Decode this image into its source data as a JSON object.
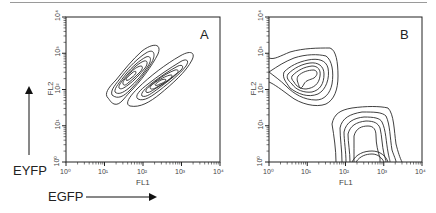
{
  "figure": {
    "annotations": {
      "y_marker": "EYFP",
      "x_marker": "EGFP"
    },
    "panels": [
      {
        "id": "A",
        "label": "A",
        "xlabel": "FL1",
        "ylabel": "FL2"
      },
      {
        "id": "B",
        "label": "B",
        "xlabel": "FL1",
        "ylabel": "FL2"
      }
    ],
    "tick_labels": [
      "10⁰",
      "10¹",
      "10²",
      "10³",
      "10⁴"
    ],
    "colors": {
      "contour": "#2a2a2a",
      "axis": "#222222",
      "rule": "#9a9a9a"
    }
  },
  "chart_data": [
    {
      "type": "contour",
      "title": "A",
      "xlabel": "FL1",
      "ylabel": "FL2",
      "xscale": "log",
      "yscale": "log",
      "xlim": [
        1,
        10000
      ],
      "ylim": [
        1,
        10000
      ],
      "xticks": [
        "10^0",
        "10^1",
        "10^2",
        "10^3",
        "10^4"
      ],
      "yticks": [
        "10^0",
        "10^1",
        "10^2",
        "10^3",
        "10^4"
      ],
      "grid": false,
      "populations": [
        {
          "name": "population 1 (diagonal, lower-left)",
          "center_FL1": 60,
          "center_FL2": 250,
          "orientation": "diagonal",
          "contour_levels": 6
        },
        {
          "name": "population 2 (diagonal, upper-right)",
          "center_FL1": 350,
          "center_FL2": 110,
          "orientation": "diagonal",
          "contour_levels": 6
        }
      ],
      "annotations": [
        "A"
      ]
    },
    {
      "type": "contour",
      "title": "B",
      "xlabel": "FL1",
      "ylabel": "FL2",
      "xscale": "log",
      "yscale": "log",
      "xlim": [
        1,
        10000
      ],
      "ylim": [
        1,
        10000
      ],
      "xticks": [
        "10^0",
        "10^1",
        "10^2",
        "10^3",
        "10^4"
      ],
      "yticks": [
        "10^0",
        "10^1",
        "10^2",
        "10^3",
        "10^4"
      ],
      "grid": false,
      "populations": [
        {
          "name": "EYFP-high population (upper-left)",
          "center_FL1": 12,
          "center_FL2": 250,
          "contour_levels": 6
        },
        {
          "name": "EGFP-high population (lower-right)",
          "center_FL1": 300,
          "center_FL2": 5,
          "contour_levels": 6
        }
      ],
      "annotations": [
        "B"
      ]
    }
  ]
}
